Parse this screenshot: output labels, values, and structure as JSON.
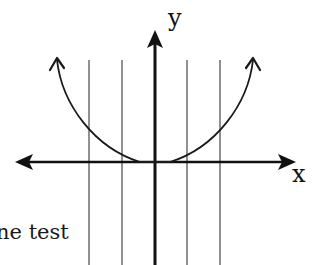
{
  "diagram": {
    "title": "",
    "axes": {
      "x_label": "x",
      "y_label": "y"
    },
    "vertical_lines_count": 4,
    "curve": "upward-opening parabola-like curve with flat bottom at origin, arrows at both ends",
    "colors": {
      "stroke": "#1a1a1a",
      "grid_line": "#555555",
      "background": "#ffffff"
    }
  },
  "caption": {
    "text": "ne test"
  }
}
